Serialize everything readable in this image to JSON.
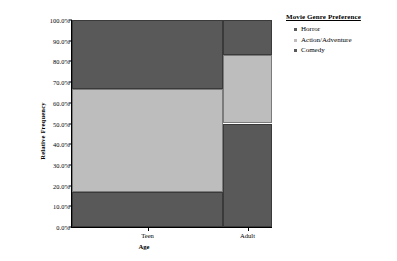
{
  "chart_data": {
    "type": "bar",
    "subtype": "mosaic-stacked-percent",
    "title": "",
    "xlabel": "Age",
    "ylabel": "Relative Frequency",
    "categories": [
      "Teen",
      "Adult"
    ],
    "category_widths_pct": [
      75.5,
      24.5
    ],
    "ylim": [
      0,
      100
    ],
    "ytick_labels": [
      "0.0%",
      "10.0%",
      "20.0%",
      "30.0%",
      "40.0%",
      "50.0%",
      "60.0%",
      "70.0%",
      "80.0%",
      "90.0%",
      "100.0%"
    ],
    "ytick_values": [
      0,
      10,
      20,
      30,
      40,
      50,
      60,
      70,
      80,
      90,
      100
    ],
    "grid": false,
    "legend_position": "right",
    "legend_title": "Movie Genre Preference",
    "series": [
      {
        "name": "Comedy",
        "color": "#595959",
        "values": [
          16.7,
          50.0
        ],
        "segments": [
          {
            "category": "Teen",
            "start": 0.0,
            "end": 16.7
          },
          {
            "category": "Adult",
            "start": 0.0,
            "end": 50.0
          }
        ]
      },
      {
        "name": "Action/Adventure",
        "color": "#bdbdbd",
        "values": [
          50.0,
          33.3
        ],
        "segments": [
          {
            "category": "Teen",
            "start": 16.7,
            "end": 66.7
          },
          {
            "category": "Adult",
            "start": 50.0,
            "end": 83.3
          }
        ]
      },
      {
        "name": "Horror",
        "color": "#595959",
        "values": [
          33.3,
          16.7
        ],
        "segments": [
          {
            "category": "Teen",
            "start": 66.7,
            "end": 100.0
          },
          {
            "category": "Adult",
            "start": 83.3,
            "end": 100.0
          }
        ]
      }
    ]
  },
  "legend": {
    "title": "Movie Genre Preference",
    "items": [
      {
        "label": "Horror",
        "color": "#595959"
      },
      {
        "label": "Action/Adventure",
        "color": "#bdbdbd"
      },
      {
        "label": "Comedy",
        "color": "#595959"
      }
    ]
  },
  "axes": {
    "y_title": "Relative Frequency",
    "x_title": "Age",
    "y_labels": [
      "100.0%",
      "90.0%",
      "80.0%",
      "70.0%",
      "60.0%",
      "50.0%",
      "40.0%",
      "30.0%",
      "20.0%",
      "10.0%",
      "0.0%"
    ],
    "x_labels": [
      "Teen",
      "Adult"
    ]
  },
  "colors": {
    "dark": "#595959",
    "light": "#bdbdbd",
    "axis": "#000000",
    "background": "#ffffff"
  }
}
